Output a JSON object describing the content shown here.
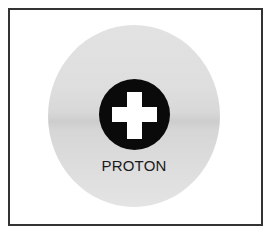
{
  "diagram": {
    "particle_label": "PROTON",
    "charge_symbol": "plus-icon",
    "colors": {
      "frame_border": "#333333",
      "cloud": "#dcdcdc",
      "cloud_band": "#cdcdcd",
      "nucleus": "#0a0a0a",
      "plus": "#ffffff",
      "label": "#1a1a1a"
    }
  }
}
